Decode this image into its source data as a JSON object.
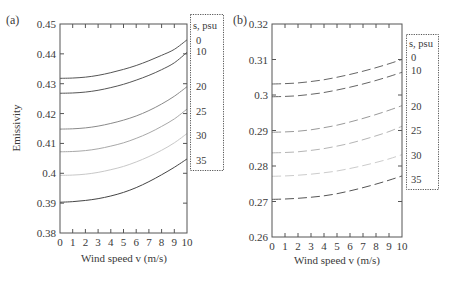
{
  "chart_data": [
    {
      "type": "line",
      "panel_label": "(a)",
      "title": "",
      "xlabel": "Wind speed v (m/s)",
      "ylabel": "Emissivity",
      "xlim": [
        0,
        10
      ],
      "ylim": [
        0.38,
        0.45
      ],
      "x_ticks": [
        "0",
        "1",
        "2",
        "3",
        "4",
        "5",
        "6",
        "7",
        "8",
        "9",
        "10"
      ],
      "y_ticks": [
        "0.38",
        "0.39",
        "0.4",
        "0.41",
        "0.42",
        "0.43",
        "0.44",
        "0.45"
      ],
      "line_style": "solid",
      "legend_title": "s, psu",
      "legend_position": "right, outside",
      "x": [
        0,
        1,
        2,
        3,
        4,
        5,
        6,
        7,
        8,
        9,
        10
      ],
      "series": [
        {
          "name": "0",
          "color": "#555555",
          "values": [
            0.4318,
            0.4319,
            0.4322,
            0.4328,
            0.4337,
            0.4348,
            0.4361,
            0.4377,
            0.4395,
            0.4415,
            0.4447
          ]
        },
        {
          "name": "10",
          "color": "#555555",
          "values": [
            0.4268,
            0.4269,
            0.4272,
            0.4278,
            0.4287,
            0.4298,
            0.4312,
            0.4328,
            0.4347,
            0.437,
            0.4405
          ]
        },
        {
          "name": "20",
          "color": "#8a8a8a",
          "values": [
            0.4148,
            0.4149,
            0.4152,
            0.4158,
            0.4167,
            0.4178,
            0.4192,
            0.421,
            0.4232,
            0.4258,
            0.429
          ]
        },
        {
          "name": "25",
          "color": "#a8a8a8",
          "values": [
            0.4072,
            0.4073,
            0.4076,
            0.4082,
            0.4091,
            0.4102,
            0.4117,
            0.4135,
            0.4157,
            0.4182,
            0.4215
          ]
        },
        {
          "name": "30",
          "color": "#c8c8c8",
          "values": [
            0.3993,
            0.3994,
            0.3997,
            0.4003,
            0.4012,
            0.4023,
            0.4038,
            0.4056,
            0.4077,
            0.4102,
            0.4133
          ]
        },
        {
          "name": "35",
          "color": "#444444",
          "values": [
            0.3903,
            0.3905,
            0.3909,
            0.3915,
            0.3924,
            0.3936,
            0.3952,
            0.3972,
            0.3995,
            0.402,
            0.4048
          ]
        }
      ]
    },
    {
      "type": "line",
      "panel_label": "(b)",
      "title": "",
      "xlabel": "Wind speed v (m/s)",
      "ylabel": "",
      "xlim": [
        0,
        10
      ],
      "ylim": [
        0.26,
        0.32
      ],
      "x_ticks": [
        "0",
        "1",
        "2",
        "3",
        "4",
        "5",
        "6",
        "7",
        "8",
        "9",
        "10"
      ],
      "y_ticks": [
        "0.26",
        "0.27",
        "0.28",
        "0.29",
        "0.3",
        "0.31",
        "0.32"
      ],
      "line_style": "dashed",
      "legend_title": "s, psu",
      "legend_position": "right, outside",
      "x": [
        0,
        1,
        2,
        3,
        4,
        5,
        6,
        7,
        8,
        9,
        10
      ],
      "series": [
        {
          "name": "0",
          "color": "#666666",
          "values": [
            0.3031,
            0.3032,
            0.3034,
            0.3038,
            0.3043,
            0.305,
            0.3058,
            0.3067,
            0.3077,
            0.3088,
            0.31
          ]
        },
        {
          "name": "10",
          "color": "#666666",
          "values": [
            0.2995,
            0.2996,
            0.2998,
            0.3002,
            0.3007,
            0.3014,
            0.3022,
            0.3031,
            0.3041,
            0.3052,
            0.3064
          ]
        },
        {
          "name": "20",
          "color": "#9a9a9a",
          "values": [
            0.2895,
            0.2896,
            0.2898,
            0.2902,
            0.2908,
            0.2915,
            0.2924,
            0.2934,
            0.2945,
            0.2957,
            0.297
          ]
        },
        {
          "name": "25",
          "color": "#b5b5b5",
          "values": [
            0.2837,
            0.2838,
            0.284,
            0.2844,
            0.2849,
            0.2856,
            0.2864,
            0.2874,
            0.2885,
            0.2897,
            0.2912
          ]
        },
        {
          "name": "30",
          "color": "#cccccc",
          "values": [
            0.2771,
            0.2772,
            0.2774,
            0.2777,
            0.2781,
            0.2786,
            0.2793,
            0.2801,
            0.281,
            0.282,
            0.2832
          ]
        },
        {
          "name": "35",
          "color": "#555555",
          "values": [
            0.2706,
            0.2707,
            0.2709,
            0.2712,
            0.2716,
            0.2722,
            0.273,
            0.2739,
            0.2749,
            0.276,
            0.2772
          ]
        }
      ]
    }
  ],
  "legend_a": {
    "title": "s, psu",
    "items": [
      "0",
      "10",
      "20",
      "25",
      "30",
      "35"
    ]
  },
  "legend_b": {
    "title": "s, psu",
    "items": [
      "0",
      "10",
      "20",
      "25",
      "30",
      "35"
    ]
  }
}
